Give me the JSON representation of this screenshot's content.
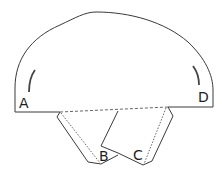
{
  "diagram": {
    "labels": {
      "A": "A",
      "B": "B",
      "C": "C",
      "D": "D"
    },
    "colors": {
      "stroke": "#3a3a3a",
      "background": "#ffffff",
      "arc_marks": "#444444"
    }
  }
}
